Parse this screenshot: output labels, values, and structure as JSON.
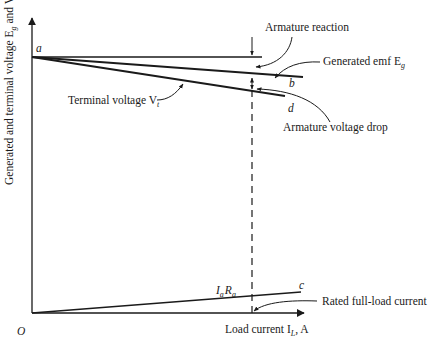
{
  "diagram": {
    "type": "dc-generator-load-characteristic",
    "y_axis_label": "Generated and terminal voltage E",
    "y_axis_label_sub_g": "g",
    "y_axis_label_and": " and V",
    "y_axis_label_sub_t": "t",
    "x_axis_label": "Load current I",
    "x_axis_label_sub": "L",
    "x_axis_label_unit": ", A",
    "origin_label": "O",
    "points": {
      "a": "a",
      "b": "b",
      "c": "c",
      "d": "d"
    },
    "annotations": {
      "armature_reaction": "Armature reaction",
      "generated_emf": "Generated emf E",
      "generated_emf_sub": "g",
      "terminal_voltage": "Terminal voltage V",
      "terminal_voltage_sub": "t",
      "armature_voltage_drop": "Armature voltage drop",
      "iara_I": "I",
      "iara_a1": "a",
      "iara_R": "R",
      "iara_a2": "a",
      "rated_full_load_current": "Rated full-load current"
    },
    "colors": {
      "line": "#1a1a1a",
      "background": "#ffffff"
    }
  }
}
